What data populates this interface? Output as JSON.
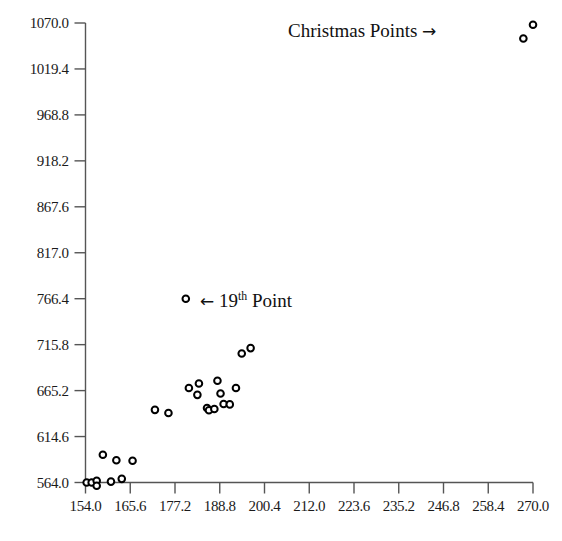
{
  "chart_data": {
    "type": "scatter",
    "title": "",
    "xlabel": "",
    "ylabel": "",
    "xlim": [
      154.0,
      270.0
    ],
    "ylim": [
      564.0,
      1070.0
    ],
    "grid": false,
    "legend": "none",
    "x_ticks": [
      "154.0",
      "165.6",
      "177.2",
      "188.8",
      "200.4",
      "212.0",
      "223.6",
      "235.2",
      "246.8",
      "258.4",
      "270.0"
    ],
    "y_ticks": [
      "1070.0",
      "1019.4",
      "968.8",
      "918.2",
      "867.6",
      "817.0",
      "766.4",
      "715.8",
      "665.2",
      "614.6",
      "564.0"
    ],
    "x_tick_values": [
      154.0,
      165.6,
      177.2,
      188.8,
      200.4,
      212.0,
      223.6,
      235.2,
      246.8,
      258.4,
      270.0
    ],
    "y_tick_values": [
      1070.0,
      1019.4,
      968.8,
      918.2,
      867.6,
      817.0,
      766.4,
      715.8,
      665.2,
      614.6,
      564.0
    ],
    "marker": "open-circle",
    "marker_color": "#000000",
    "marker_fill": "#ffffff",
    "series": [
      {
        "name": "Main Points",
        "points": [
          [
            154.3,
            564.0
          ],
          [
            155.6,
            564.0
          ],
          [
            156.9,
            566.0
          ],
          [
            156.9,
            560.5
          ],
          [
            160.6,
            565.0
          ],
          [
            163.4,
            568.0
          ],
          [
            158.5,
            594.5
          ],
          [
            162.0,
            588.5
          ],
          [
            166.2,
            588.0
          ],
          [
            172.0,
            644.0
          ],
          [
            175.5,
            640.5
          ],
          [
            180.8,
            668.0
          ],
          [
            183.0,
            660.5
          ],
          [
            183.4,
            673.0
          ],
          [
            185.5,
            646.0
          ],
          [
            186.0,
            643.5
          ],
          [
            187.4,
            645.0
          ],
          [
            188.2,
            676.0
          ],
          [
            189.0,
            662.0
          ],
          [
            189.8,
            650.5
          ],
          [
            191.4,
            650.0
          ],
          [
            193.0,
            668.0
          ],
          [
            194.5,
            706.0
          ],
          [
            196.8,
            712.0
          ]
        ]
      },
      {
        "name": "19th Point",
        "points": [
          [
            180.0,
            766.4
          ]
        ]
      },
      {
        "name": "Christmas Points",
        "points": [
          [
            270.0,
            1068.0
          ],
          [
            267.5,
            1053.0
          ]
        ]
      }
    ],
    "annotations": [
      {
        "name": "christmas-points",
        "text": "Christmas Points",
        "arrow": "→",
        "arrow_direction": "right"
      },
      {
        "name": "nineteenth-point",
        "text_before": "19",
        "text_superscript": "th",
        "text_after": "Point",
        "arrow": "←",
        "arrow_direction": "left"
      }
    ],
    "axis_color": "#555555"
  }
}
